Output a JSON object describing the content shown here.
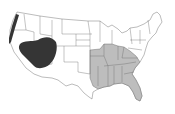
{
  "map": {
    "title": "",
    "region": "United States (contiguous)",
    "colors": {
      "background": "#ffffff",
      "state_fill": "#ffffff",
      "state_border": "#6a6a6a",
      "light_region": "#bdbdbd",
      "dark_region": "#353535"
    },
    "regions": [
      {
        "name": "dark-region-great-basin",
        "shade": "dark",
        "description": "Great Basin / Southwest (Nevada, Utah, northern Arizona, eastern California)"
      },
      {
        "name": "dark-region-pacific-coast",
        "shade": "dark",
        "description": "Northern California / Oregon coast strip"
      },
      {
        "name": "light-region-southeast",
        "shade": "light",
        "states": [
          "East Texas",
          "Oklahoma (east)",
          "Arkansas",
          "Louisiana",
          "Missouri (south)",
          "Illinois (south)",
          "Indiana (south)",
          "Kentucky",
          "Tennessee",
          "Mississippi",
          "Alabama",
          "Georgia",
          "Florida",
          "South Carolina",
          "North Carolina (west)"
        ]
      }
    ]
  }
}
